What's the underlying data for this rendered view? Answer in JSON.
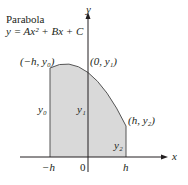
{
  "title": {
    "line1": "Parabola",
    "line2": "y = Ax² + Bx + C"
  },
  "axes": {
    "x_label": "x",
    "y_label": "y"
  },
  "points": {
    "left": "(−h, y₀)",
    "middle": "(0, y₁)",
    "right": "(h, y₂)"
  },
  "heights": {
    "y0": "y₀",
    "y1": "y₁",
    "y2": "y₂"
  },
  "ticks": {
    "neg_h": "−h",
    "zero": "0",
    "h": "h"
  },
  "colors": {
    "fill": "#d9d9d9",
    "stroke": "#231f20"
  }
}
